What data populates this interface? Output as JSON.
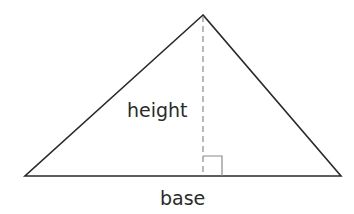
{
  "diagram": {
    "type": "triangle-area",
    "labels": {
      "height": "height",
      "base": "base"
    },
    "colors": {
      "stroke": "#2a2a2a",
      "dashed": "#8a8a8a",
      "right_angle": "#8a8a8a",
      "text": "#2a2a2a",
      "background": "#ffffff"
    }
  }
}
